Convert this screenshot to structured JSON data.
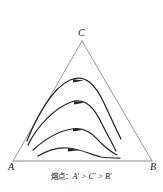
{
  "figure": {
    "type": "ternary-phase-diagram",
    "background_color": "#ffffff",
    "triangle": {
      "edge_color": "#8c8c8c",
      "fill": "none",
      "vertices": {
        "top": {
          "label": "C",
          "x": 82,
          "y": 41
        },
        "bottom_left": {
          "label": "A",
          "x": 13,
          "y": 161
        },
        "bottom_right": {
          "label": "B",
          "x": 152,
          "y": 161
        }
      }
    },
    "curves": {
      "color": "#262626",
      "count": 4,
      "description": "four nested arched crystallization path curves rising from near vertex A and falling toward edge BC, each carrying a rightward arrowhead at its apex",
      "items": [
        {
          "name": "curve-1",
          "apex_x": 79,
          "apex_y": 80,
          "arrow_direction": "right"
        },
        {
          "name": "curve-2",
          "apex_x": 80,
          "apex_y": 102,
          "arrow_direction": "right"
        },
        {
          "name": "curve-3",
          "apex_x": 79,
          "apex_y": 129,
          "arrow_direction": "right"
        },
        {
          "name": "curve-4",
          "apex_x": 73,
          "apex_y": 148,
          "arrow_direction": "right"
        }
      ]
    },
    "caption": {
      "prefix": "熔点：",
      "relation": "A′ > C′ > B′",
      "full_text": "熔点：A′ > C′ > B′"
    }
  }
}
